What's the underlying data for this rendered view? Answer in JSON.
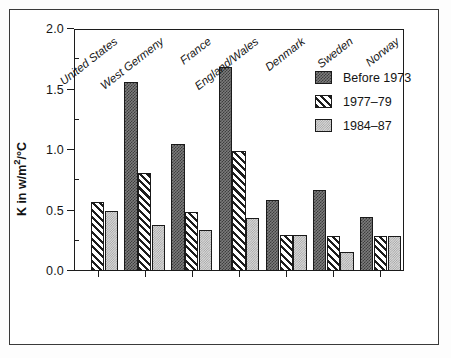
{
  "chart_data": {
    "type": "bar",
    "title": "",
    "subtitle": "",
    "xlabel": "",
    "ylabel": "K in w/m2/°C",
    "ylabel_parts": {
      "pre": "K in w/m",
      "sup": "2",
      "post": "/°C"
    },
    "ylim": [
      0.0,
      2.0
    ],
    "ytick_labels": [
      "0.0",
      "0.5",
      "1.0",
      "1.5",
      "2.0"
    ],
    "ytick_values": [
      0.0,
      0.5,
      1.0,
      1.5,
      2.0
    ],
    "yminor_values": [
      0.25,
      0.75,
      1.25,
      1.75
    ],
    "grid": false,
    "legend_position": "top-right",
    "categories": [
      "United States",
      "West Germeny",
      "France",
      "England/Wales",
      "Denmark",
      "Sweden",
      "Norway"
    ],
    "series": [
      {
        "name": "Before 1973",
        "pattern": "dark-checker",
        "color": "#6f6f6f",
        "values": [
          null,
          1.56,
          1.05,
          1.69,
          0.59,
          0.67,
          0.45
        ]
      },
      {
        "name": "1977–79",
        "pattern": "diagonal-hatch",
        "color": "#1d1d1d",
        "values": [
          0.57,
          0.81,
          0.49,
          0.99,
          0.3,
          0.29,
          0.29
        ]
      },
      {
        "name": "1984–87",
        "pattern": "light-stipple",
        "color": "#cfcfcf",
        "values": [
          0.5,
          0.38,
          0.34,
          0.44,
          0.3,
          0.16,
          0.29
        ]
      }
    ]
  },
  "legend": {
    "entries": [
      {
        "label": "Before 1973"
      },
      {
        "label": "1977–79"
      },
      {
        "label": "1984–87"
      }
    ]
  }
}
